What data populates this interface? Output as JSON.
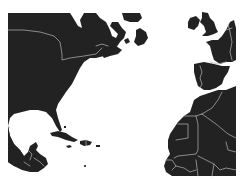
{
  "map": {
    "region": "North Atlantic",
    "colors": {
      "water": "#ffffff",
      "land": "#222222",
      "border": "#b8b8b8"
    },
    "landmasses": [
      {
        "name": "North America"
      },
      {
        "name": "Newfoundland"
      },
      {
        "name": "Cuba"
      },
      {
        "name": "Hispaniola"
      },
      {
        "name": "Jamaica"
      },
      {
        "name": "Puerto Rico"
      },
      {
        "name": "Ireland"
      },
      {
        "name": "Great Britain"
      },
      {
        "name": "France"
      },
      {
        "name": "Iberian Peninsula"
      },
      {
        "name": "Northwest Africa"
      }
    ]
  }
}
